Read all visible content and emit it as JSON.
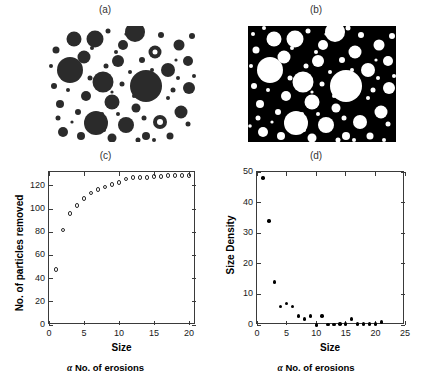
{
  "figure": {
    "panels": [
      {
        "id": "a",
        "label": "(a)"
      },
      {
        "id": "b",
        "label": "(b)"
      },
      {
        "id": "c",
        "label": "(c)"
      },
      {
        "id": "d",
        "label": "(d)"
      }
    ]
  },
  "panel_a": {
    "label": "(a)",
    "description": "binary image of dark particles on white background",
    "background_color": "#ffffff",
    "particle_color": "#2b2b2b"
  },
  "panel_b": {
    "label": "(b)",
    "description": "inverted binary image of white particles on black background",
    "background_color": "#000000",
    "particle_color": "#ffffff"
  },
  "chart_data": [
    {
      "panel": "(c)",
      "type": "scatter",
      "title": "(c)",
      "xlabel": "Size",
      "ylabel": "No. of particles removed",
      "caption": "No. of erosions",
      "caption_symbol": "α",
      "marker": "open-circle",
      "xlim": [
        0,
        21
      ],
      "ylim": [
        0,
        132
      ],
      "xticks": [
        0,
        5,
        10,
        15,
        20
      ],
      "yticks": [
        0,
        20,
        40,
        60,
        80,
        100,
        120
      ],
      "grid": false,
      "x": [
        1,
        2,
        3,
        4,
        5,
        6,
        7,
        8,
        9,
        10,
        11,
        12,
        13,
        14,
        15,
        16,
        17,
        18,
        19,
        20
      ],
      "values": [
        48,
        82,
        96,
        103,
        109,
        114,
        117,
        119,
        121,
        123,
        126,
        127,
        127,
        127,
        128,
        128,
        129,
        129,
        129,
        129
      ]
    },
    {
      "panel": "(d)",
      "type": "scatter",
      "title": "(d)",
      "xlabel": "Size",
      "ylabel": "Size Density",
      "caption": "No. of erosions",
      "caption_symbol": "α",
      "marker": "filled-circle",
      "xlim": [
        0,
        25
      ],
      "ylim": [
        0,
        50
      ],
      "xticks": [
        0,
        5,
        10,
        15,
        20,
        25
      ],
      "yticks": [
        0,
        10,
        20,
        30,
        40,
        50
      ],
      "grid": false,
      "x": [
        1,
        2,
        3,
        4,
        5,
        6,
        7,
        8,
        9,
        10,
        11,
        12,
        13,
        14,
        15,
        16,
        17,
        18,
        19,
        20,
        21
      ],
      "values": [
        48,
        34,
        14,
        6,
        7,
        6,
        3,
        2,
        3,
        0,
        3,
        0.2,
        0.2,
        0.3,
        0.3,
        2,
        0.3,
        0.3,
        0.3,
        0.3,
        1
      ]
    }
  ]
}
